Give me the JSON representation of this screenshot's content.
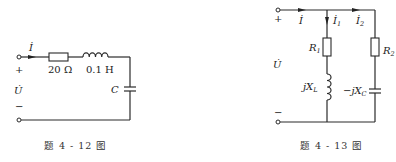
{
  "figures": [
    {
      "id": "fig-4-12",
      "caption": "题 4 - 12 图",
      "labels": {
        "current": "İ",
        "voltage": "U̇",
        "plus": "+",
        "minus": "−",
        "resistor": "20 Ω",
        "inductor": "0.1 H",
        "capacitor": "C"
      }
    },
    {
      "id": "fig-4-13",
      "caption": "题 4 - 13 图",
      "labels": {
        "current": "İ",
        "current1_base": "İ",
        "current1_sub": "1",
        "current2_base": "İ",
        "current2_sub": "2",
        "voltage": "U̇",
        "plus": "+",
        "minus": "−",
        "r1_base": "R",
        "r1_sub": "1",
        "r2_base": "R",
        "r2_sub": "2",
        "inductor_base": "jX",
        "inductor_sub": "L",
        "capacitor_base": "−jX",
        "capacitor_sub": "C"
      }
    }
  ]
}
